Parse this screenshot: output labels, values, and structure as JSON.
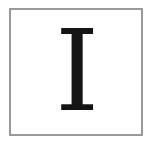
{
  "card": {
    "letter": "I",
    "border_color": "#9a9a9a",
    "letter_color": "#141414"
  }
}
